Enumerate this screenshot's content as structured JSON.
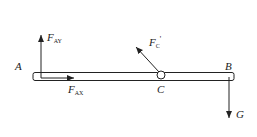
{
  "diagram": {
    "type": "free-body-diagram",
    "beam": {
      "left_label": "A",
      "right_label": "B",
      "pin_label": "C"
    },
    "forces": [
      {
        "id": "F_AY",
        "main": "F",
        "sub": "AY",
        "direction": "up",
        "at": "A"
      },
      {
        "id": "F_AX",
        "main": "F",
        "sub": "AX",
        "direction": "right",
        "at": "A"
      },
      {
        "id": "F_C_prime",
        "main": "F",
        "sub": "C",
        "prime": "'",
        "direction": "up-left",
        "at": "C"
      },
      {
        "id": "G",
        "main": "G",
        "direction": "down",
        "at": "B"
      }
    ],
    "colors": {
      "line": "#222222",
      "background": "#ffffff"
    }
  }
}
